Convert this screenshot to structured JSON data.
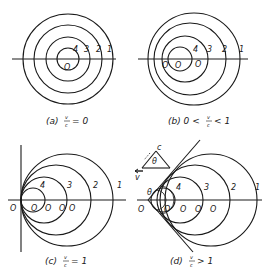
{
  "figure": {
    "stroke_color": "#1a1a1a",
    "background": "#ffffff",
    "panels": [
      {
        "id": "a",
        "caption_prefix": "(a)",
        "condition": "v/c = 0",
        "caption": "(a)  v/c = 0",
        "center_label": "O",
        "circle_labels": [
          "1",
          "2",
          "3",
          "4"
        ]
      },
      {
        "id": "b",
        "caption_prefix": "(b)",
        "condition": "0 < v/c < 1",
        "caption": "(b)  0 < v/c < 1",
        "center_labels": [
          "O4",
          "O1",
          "O"
        ],
        "circle_labels": [
          "1",
          "2",
          "3",
          "4"
        ]
      },
      {
        "id": "c",
        "caption_prefix": "(c)",
        "condition": "v/c = 1",
        "caption": "(c)  v/c = 1",
        "center_labels": [
          "O4'",
          "O3",
          "O2",
          "O1",
          "O"
        ],
        "circle_labels": [
          "1",
          "2",
          "3",
          "4"
        ]
      },
      {
        "id": "d",
        "caption_prefix": "(d)",
        "condition": "v/c > 1",
        "caption": "(d)  v/c > 1",
        "center_labels": [
          "O4",
          "O3",
          "O2",
          "O1",
          "O"
        ],
        "circle_labels": [
          "1",
          "2",
          "3",
          "4"
        ],
        "angle_label": "θ",
        "inset": {
          "hyp_label": "c",
          "base_label": "v",
          "angle_label": "θ"
        }
      }
    ]
  },
  "labels": {
    "one": "1",
    "two": "2",
    "three": "3",
    "four": "4",
    "O": "O",
    "O1": "O",
    "O2": "O",
    "O3": "O",
    "O4": "O",
    "s1": "1",
    "s2": "2",
    "s3": "3",
    "s4": "4",
    "theta": "θ",
    "c": "c",
    "v": "v",
    "cap_a_pre": "(a)",
    "cap_a_rel": "= 0",
    "cap_b_pre": "(b) 0 <",
    "cap_b_rel": "< 1",
    "cap_c_pre": "(c)",
    "cap_c_rel": "= 1",
    "cap_d_pre": "(d)",
    "cap_d_rel": "> 1",
    "frac_num": "v",
    "frac_den": "c"
  }
}
